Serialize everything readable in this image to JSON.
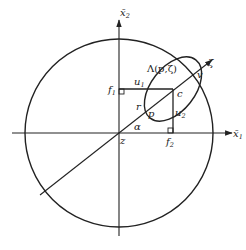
{
  "diagram": {
    "axes": {
      "x1_label": "x̄",
      "x1_sub": "1",
      "x2_label": "x̄",
      "x2_sub": "2"
    },
    "points": {
      "origin": "z",
      "center": "c",
      "point_p": "p",
      "point_v": "v",
      "f1": "f",
      "f1_sub": "1",
      "f2": "f",
      "f2_sub": "2"
    },
    "segments": {
      "u1": "u",
      "u1_sub": "1",
      "u2": "u",
      "u2_sub": "2",
      "r": "r"
    },
    "angle": "α",
    "ray_label": "ζ",
    "ellipse_label": "Λ(p,ζ)"
  }
}
